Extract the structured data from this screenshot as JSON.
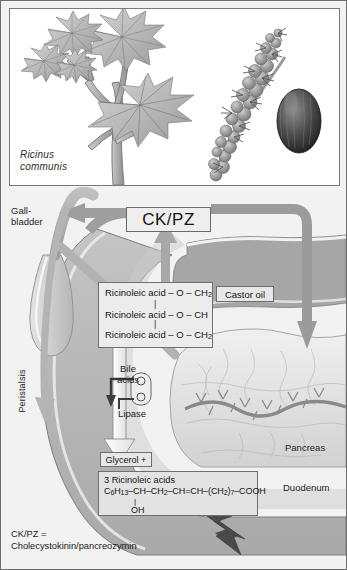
{
  "figure": {
    "title_species": "Ricinus\ncommunis",
    "species_line1": "Ricinus",
    "species_line2": "communis"
  },
  "labels": {
    "gallbladder_line1": "Gall-",
    "gallbladder_line2": "bladder",
    "peristalsis": "Peristalsis",
    "pancreas": "Pancreas",
    "duodenum": "Duodenum",
    "bile_line1": "Bile",
    "bile_line2": "acids",
    "lipase": "Lipase"
  },
  "boxes": {
    "ckpz": "CK/PZ",
    "castor_oil": "Castor oil",
    "glycerol": "Glycerol +",
    "triglyceride": {
      "line1": "Ricinoleic acid – O – CH2",
      "line1_base": "Ricinoleic acid – O – CH",
      "line1_sub": "2",
      "line2": "Ricinoleic acid – O – CH",
      "line3_base": "Ricinoleic acid – O – CH",
      "line3_sub": "2",
      "bond": "|"
    },
    "ricinoleic": {
      "title": "3 Ricinoleic acids",
      "formula_c": "C",
      "formula_c_sub": "6",
      "formula_h": "H",
      "formula_h_sub": "13",
      "formula_rest": "–CH–CH2–CH=CH–(CH2)7–COOH",
      "formula_full": "C6H13–CH–CH2–CH=CH–(CH2)7–COOH",
      "hydroxyl": "OH"
    }
  },
  "legend": {
    "line1": "CK/PZ =",
    "line2": "Cholecystokinin/pancreozymin"
  },
  "icons": {
    "plant": "ricinus-plant-illustration",
    "inflorescence": "ricinus-inflorescence-illustration",
    "seed": "ricinus-seed-illustration",
    "gallbladder": "gallbladder-shape",
    "pancreas": "pancreas-shape",
    "duodenum": "duodenum-shape",
    "lightning_arrow": "lightning-bolt-arrow",
    "peristalsis_arrow": "peristalsis-down-arrow",
    "ckpz_up_arrow": "ckpz-stimulus-up-arrow",
    "ckpz_left_arrow": "ckpz-to-gallbladder-arrow",
    "ckpz_right_arrow": "ckpz-to-pancreas-arrow",
    "lipase_arrow": "lipase-action-arrow",
    "bile_arrow": "bile-acids-down-arrow"
  },
  "colors": {
    "page_bg": "#f2f2f2",
    "panel_bg": "#ffffff",
    "border": "#6d6d6d",
    "duct_gray": "#9b9b9b",
    "duodenum_fill": "#bdbdbd",
    "pancreas_fill": "#e3e3e3",
    "box_fill": "#e7e7e7",
    "text": "#1a1a1a",
    "arrow_dark": "#6a6a6a"
  }
}
